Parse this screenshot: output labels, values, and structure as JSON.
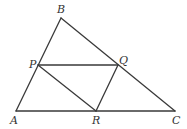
{
  "diagram": {
    "type": "geometry",
    "points": {
      "A": {
        "x": 16,
        "y": 111,
        "label": "A",
        "lx": 10,
        "ly": 124
      },
      "B": {
        "x": 61,
        "y": 18,
        "label": "B",
        "lx": 57,
        "ly": 13
      },
      "C": {
        "x": 175,
        "y": 111,
        "label": "C",
        "lx": 172,
        "ly": 124
      },
      "P": {
        "x": 38,
        "y": 65,
        "label": "P",
        "lx": 29,
        "ly": 68
      },
      "Q": {
        "x": 118,
        "y": 65,
        "label": "Q",
        "lx": 119,
        "ly": 64
      },
      "R": {
        "x": 96,
        "y": 111,
        "label": "R",
        "lx": 92,
        "ly": 124
      }
    },
    "segments": [
      [
        "A",
        "B"
      ],
      [
        "B",
        "C"
      ],
      [
        "A",
        "C"
      ],
      [
        "P",
        "Q"
      ],
      [
        "P",
        "R"
      ],
      [
        "Q",
        "R"
      ]
    ],
    "stroke_color": "#3a3a3a",
    "label_color": "#333333"
  }
}
